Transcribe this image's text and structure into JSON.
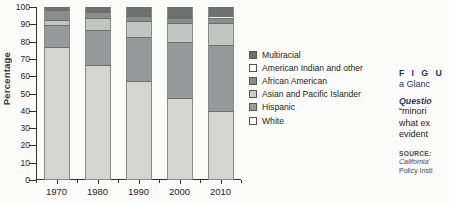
{
  "chart_data": {
    "type": "bar",
    "stacked": true,
    "title": "",
    "xlabel": "",
    "ylabel": "Percentage",
    "ylim": [
      0,
      100
    ],
    "ytick_step": 10,
    "yticks": [
      0,
      10,
      20,
      30,
      40,
      50,
      60,
      70,
      80,
      90,
      100
    ],
    "grid": false,
    "legend_position": "right",
    "categories": [
      "1970",
      "1980",
      "1990",
      "2000",
      "2010"
    ],
    "series": [
      {
        "name": "White",
        "color": "#d4d5d0",
        "values": [
          77,
          66.5,
          57,
          47.5,
          40
        ]
      },
      {
        "name": "Hispanic",
        "color": "#97999a",
        "values": [
          12.5,
          20,
          25.5,
          32.5,
          38
        ]
      },
      {
        "name": "Asian and Pacific Islander",
        "color": "#c3c5c2",
        "values": [
          3,
          7,
          9.5,
          11,
          13
        ]
      },
      {
        "name": "African American",
        "color": "#8a8c8d",
        "values": [
          5.5,
          3.5,
          3,
          2.5,
          2.5
        ]
      },
      {
        "name": "American Indian and other",
        "color": "#ededea",
        "values": [
          0.5,
          0.5,
          0.5,
          1,
          1.5
        ]
      },
      {
        "name": "Multiracial",
        "color": "#6d6f70",
        "values": [
          1.5,
          2.5,
          4.5,
          5.5,
          5
        ]
      }
    ]
  },
  "legend": {
    "items": [
      {
        "label": "Multiracial",
        "color": "#6d6f70"
      },
      {
        "label": "American Indian and other",
        "color": "#ffffff"
      },
      {
        "label": "African American",
        "color": "#8a8c8d"
      },
      {
        "label": "Asian and Pacific Islander",
        "color": "#c9cbc8"
      },
      {
        "label": "Hispanic",
        "color": "#97999a"
      },
      {
        "label": "White",
        "color": "#fafaf7"
      }
    ]
  },
  "caption": {
    "figure_label": "F I G U",
    "figure_title": "a Glanc",
    "question_label": "Questio",
    "question_lines": [
      "“minori",
      "what ex",
      "evident"
    ],
    "source_label": "SOURCE:",
    "source_lines": [
      "California'",
      "Policy Insti"
    ]
  }
}
